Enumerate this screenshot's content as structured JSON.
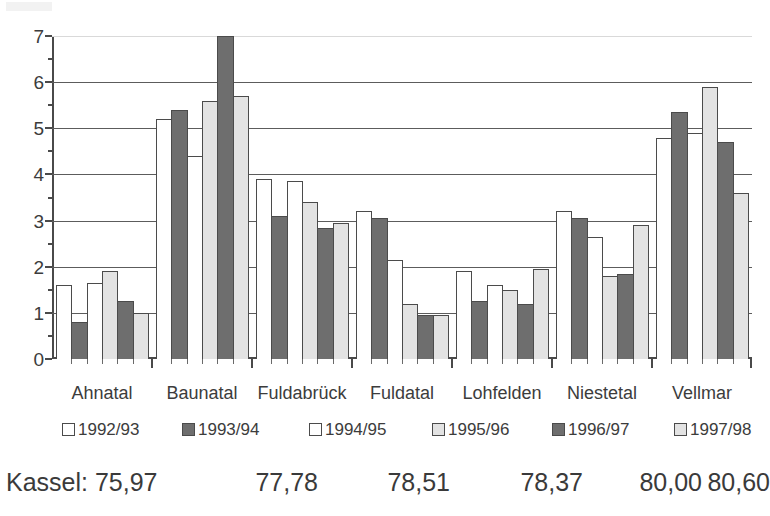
{
  "chart_data": {
    "type": "bar",
    "title": "",
    "subtitle": "",
    "xlabel": "",
    "ylabel": "",
    "ylim": [
      0,
      7
    ],
    "yticks": [
      0,
      1,
      2,
      3,
      4,
      5,
      6,
      7
    ],
    "ytick_labels": [
      "0",
      "1",
      "2",
      "3",
      "4",
      "5",
      "6",
      "7"
    ],
    "grid": true,
    "grid_axis": "y",
    "legend_position": "bottom",
    "categories": [
      "Ahnatal",
      "Baunatal",
      "Fuldabrück",
      "Fuldatal",
      "Lohfelden",
      "Niestetal",
      "Vellmar"
    ],
    "series": [
      {
        "name": "1992/93",
        "color": "#ffffff",
        "swatch": "sw-white",
        "values": [
          1.6,
          5.2,
          3.9,
          3.2,
          1.9,
          3.2,
          4.8
        ]
      },
      {
        "name": "1993/94",
        "color": "#6e6e6e",
        "swatch": "sw-dark",
        "values": [
          0.8,
          5.4,
          3.1,
          3.05,
          1.25,
          3.05,
          5.35
        ]
      },
      {
        "name": "1994/95",
        "color": "#ffffff",
        "swatch": "sw-white",
        "values": [
          1.65,
          4.4,
          3.85,
          2.15,
          1.6,
          2.65,
          4.9
        ]
      },
      {
        "name": "1995/96",
        "color": "#e3e3e3",
        "swatch": "sw-light",
        "values": [
          1.9,
          5.6,
          3.4,
          1.2,
          1.5,
          1.8,
          5.9
        ]
      },
      {
        "name": "1996/97",
        "color": "#6e6e6e",
        "swatch": "sw-dark",
        "values": [
          1.25,
          7.0,
          2.85,
          0.95,
          1.2,
          1.85,
          4.7
        ]
      },
      {
        "name": "1997/98",
        "color": "#e3e3e3",
        "swatch": "sw-light",
        "values": [
          1.0,
          5.7,
          2.95,
          0.95,
          1.95,
          2.9,
          3.6
        ]
      }
    ]
  },
  "legend": {
    "items": [
      {
        "label": "1992/93",
        "swatch": "sw-white"
      },
      {
        "label": "1993/94",
        "swatch": "sw-dark"
      },
      {
        "label": "1994/95",
        "swatch": "sw-white"
      },
      {
        "label": "1995/96",
        "swatch": "sw-light"
      },
      {
        "label": "1996/97",
        "swatch": "sw-dark"
      },
      {
        "label": "1997/98",
        "swatch": "sw-light"
      }
    ]
  },
  "footer": {
    "label": "Kassel: 75,97",
    "values": [
      "77,78",
      "78,51",
      "78,37",
      "80,00",
      "80,60"
    ]
  },
  "colors": {
    "series_white": "#ffffff",
    "series_dark": "#6e6e6e",
    "series_light": "#e3e3e3",
    "axis": "#4a4a4a",
    "text": "#3a3a3a"
  }
}
